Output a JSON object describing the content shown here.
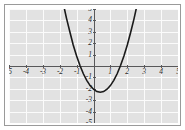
{
  "figure": {
    "title": "",
    "background_color": "#ffffff",
    "plot_background_color": "#e2e2e2",
    "grid_color": "#fbfbfb",
    "axis_color": "#58585a",
    "curve_color": "#1a1a1a",
    "border_color": "#9a9a9a"
  },
  "chart_data": {
    "type": "line",
    "title": "",
    "xlabel": "",
    "ylabel": "",
    "xlim": [
      -5,
      5
    ],
    "ylim": [
      -5,
      5
    ],
    "grid": true,
    "legend": null,
    "xticks": [
      -5,
      -4,
      -3,
      -2,
      -1,
      1,
      2,
      3,
      4,
      5
    ],
    "yticks": [
      5,
      4,
      3,
      2,
      1,
      -1,
      -2,
      -3,
      -4,
      -5
    ],
    "xtick_labels": [
      "-5",
      "-4",
      "-3",
      "-2",
      "-1",
      "1",
      "2",
      "3",
      "4",
      "5"
    ],
    "ytick_labels": [
      "5",
      "4",
      "3",
      "2",
      "1",
      "-1",
      "-2",
      "-3",
      "-4",
      "-5"
    ],
    "series": [
      {
        "name": "parabola",
        "type": "quadratic",
        "equation": "y = 1.62x^2 - 1.3x - 2.04",
        "vertex": [
          0.4,
          -2.3
        ],
        "roots": [
          -0.96,
          1.76
        ],
        "y_intercept": -2.04,
        "x": [
          -2.05,
          -1.8,
          -1.6,
          -1.4,
          -1.2,
          -1.0,
          -0.8,
          -0.6,
          -0.4,
          -0.2,
          0.0,
          0.2,
          0.4,
          0.6,
          0.8,
          1.0,
          1.2,
          1.4,
          1.6,
          1.8,
          2.0,
          2.2,
          2.4,
          2.6,
          2.8,
          3.0,
          3.15
        ],
        "y": [
          7.43,
          5.55,
          4.2,
          3.0,
          1.85,
          0.88,
          0.04,
          -0.68,
          -1.26,
          -1.72,
          -2.04,
          -2.24,
          -2.3,
          -2.24,
          -2.04,
          -1.72,
          -1.26,
          -0.68,
          0.04,
          0.88,
          1.85,
          2.96,
          4.16,
          5.5,
          6.98,
          8.56,
          9.58
        ]
      }
    ]
  },
  "axes": {
    "x_axis_label_values": [
      "-5",
      "-4",
      "-3",
      "-2",
      "-1",
      "1",
      "2",
      "3",
      "4",
      "5"
    ],
    "y_axis_label_values": [
      "5",
      "4",
      "3",
      "2",
      "1",
      "-1",
      "-2",
      "-3",
      "-4",
      "-5"
    ]
  }
}
